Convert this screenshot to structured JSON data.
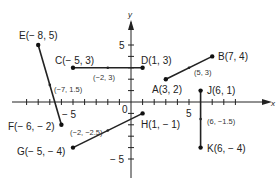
{
  "axes": {
    "x_label": "x",
    "y_label": "y",
    "origin_label": "0",
    "x_tick_5": "5",
    "x_tick_neg5": "− 5",
    "y_tick_5": "5",
    "y_tick_neg5": "− 5"
  },
  "points": {
    "E": "E(− 8, 5)",
    "F": "F(− 6, − 2)",
    "C": "C(− 5, 3)",
    "D": "D(1, 3)",
    "A": "A(3, 2)",
    "B": "B(7, 4)",
    "J": "J(6, 1)",
    "K": "K(6, − 4)",
    "G": "G(− 5, − 4)",
    "H": "H(1, − 1)"
  },
  "midpoints": {
    "EF": "(−7, 1.5)",
    "CD": "(−2, 3)",
    "AB": "(5, 3)",
    "JK": "(6, −1.5)",
    "GH": "(−2, −2.5)"
  },
  "segments": [
    {
      "from": "E",
      "to": "F",
      "coords": [
        [
          -8,
          5
        ],
        [
          -6,
          -2
        ]
      ],
      "midpoint": [
        -7,
        1.5
      ]
    },
    {
      "from": "C",
      "to": "D",
      "coords": [
        [
          -5,
          3
        ],
        [
          1,
          3
        ]
      ],
      "midpoint": [
        -2,
        3
      ]
    },
    {
      "from": "A",
      "to": "B",
      "coords": [
        [
          3,
          2
        ],
        [
          7,
          4
        ]
      ],
      "midpoint": [
        5,
        3
      ]
    },
    {
      "from": "J",
      "to": "K",
      "coords": [
        [
          6,
          1
        ],
        [
          6,
          -4
        ]
      ],
      "midpoint": [
        6,
        -1.5
      ]
    },
    {
      "from": "G",
      "to": "H",
      "coords": [
        [
          -5,
          -4
        ],
        [
          1,
          -1
        ]
      ],
      "midpoint": [
        -2,
        -2.5
      ]
    }
  ]
}
